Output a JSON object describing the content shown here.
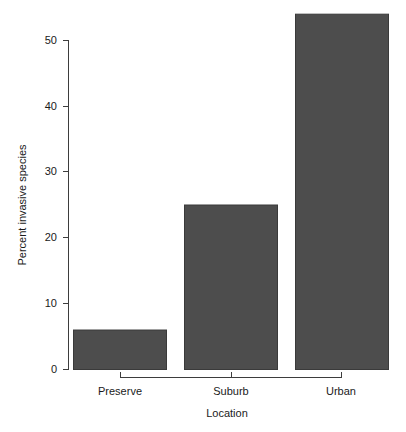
{
  "chart_data": {
    "type": "bar",
    "title": "",
    "categories": [
      "Preserve",
      "Suburb",
      "Urban"
    ],
    "values": [
      6,
      25,
      54
    ],
    "xlabel": "Location",
    "ylabel": "Percent invasive species",
    "ylim": [
      0,
      54.5
    ],
    "yticks": [
      0,
      10,
      20,
      30,
      40,
      50
    ],
    "ytick_labels": [
      "0",
      "10",
      "20",
      "30",
      "40",
      "50"
    ],
    "grid": false,
    "legend": null,
    "bar_color": "#4d4d4d",
    "bar_border_color": "#3a3a3a",
    "axis_color": "#3d3d3d",
    "background_color": "#ffffff",
    "text_color": "#1a1a1a"
  },
  "axis": {
    "y_title": "Percent invasive species",
    "x_title": "Location",
    "y_tick_0": "0",
    "y_tick_10": "10",
    "y_tick_20": "20",
    "y_tick_30": "30",
    "y_tick_40": "40",
    "y_tick_50": "50",
    "x_cat_0": "Preserve",
    "x_cat_1": "Suburb",
    "x_cat_2": "Urban"
  }
}
